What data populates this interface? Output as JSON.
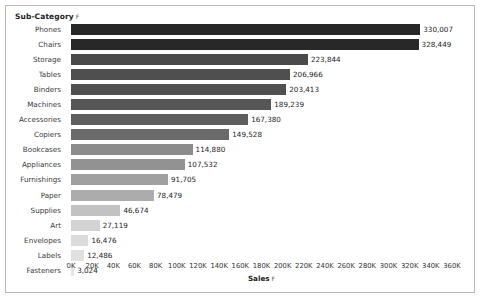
{
  "header": {
    "field_label": "Sub-Category",
    "sort_indicator": "F"
  },
  "axis_title": {
    "label": "Sales",
    "sort_indicator": "F"
  },
  "chart_data": {
    "type": "bar",
    "orientation": "horizontal",
    "title": "",
    "xlabel": "Sales",
    "ylabel": "Sub-Category",
    "xlim": [
      0,
      360000
    ],
    "grid": false,
    "legend": "none",
    "tick_labels": [
      "0K",
      "20K",
      "40K",
      "60K",
      "80K",
      "100K",
      "120K",
      "140K",
      "160K",
      "180K",
      "200K",
      "220K",
      "240K",
      "260K",
      "280K",
      "300K",
      "320K",
      "340K",
      "360K"
    ],
    "tick_values": [
      0,
      20000,
      40000,
      60000,
      80000,
      100000,
      120000,
      140000,
      160000,
      180000,
      200000,
      220000,
      240000,
      260000,
      280000,
      300000,
      320000,
      340000,
      360000
    ],
    "categories": [
      "Phones",
      "Chairs",
      "Storage",
      "Tables",
      "Binders",
      "Machines",
      "Accessories",
      "Copiers",
      "Bookcases",
      "Appliances",
      "Furnishings",
      "Paper",
      "Supplies",
      "Art",
      "Envelopes",
      "Labels",
      "Fasteners"
    ],
    "values": [
      330007,
      328449,
      223844,
      206966,
      203413,
      189239,
      167380,
      149528,
      114880,
      107532,
      91705,
      78479,
      46674,
      27119,
      16476,
      12486,
      3024
    ],
    "value_labels": [
      "330,007",
      "328,449",
      "223,844",
      "206,966",
      "203,413",
      "189,239",
      "167,380",
      "149,528",
      "114,880",
      "107,532",
      "91,705",
      "78,479",
      "46,674",
      "27,119",
      "16,476",
      "12,486",
      "3,024"
    ],
    "bar_colors": [
      "#272727",
      "#282828",
      "#4a4a4a",
      "#4f4f4f",
      "#505050",
      "#565656",
      "#5e5e5e",
      "#6a6a6a",
      "#8c8c8c",
      "#929292",
      "#a0a0a0",
      "#acacac",
      "#c2c2c2",
      "#d2d2d2",
      "#dcdcdc",
      "#e0e0e0",
      "#e6e6e6"
    ]
  }
}
